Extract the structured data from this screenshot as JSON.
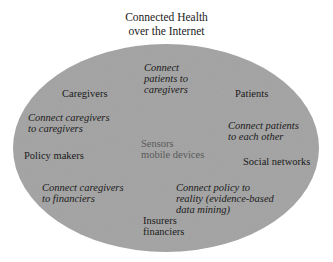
{
  "title": {
    "line1": "Connected Health",
    "line2": "over the Internet"
  },
  "ellipse": {
    "fill": "#a3a3a3",
    "cx": 166,
    "cy": 148,
    "rx": 153,
    "ry": 104
  },
  "center": {
    "line1": "Sensors",
    "line2": "mobile devices"
  },
  "stakeholders": {
    "caregivers": "Caregivers",
    "patients": "Patients",
    "policy_makers": "Policy makers",
    "social_networks": "Social networks",
    "insurers_line1": "Insurers",
    "insurers_line2": "financiers"
  },
  "connections": {
    "patients_caregivers": [
      "Connect",
      "patients to",
      "caregivers"
    ],
    "caregivers_caregivers": [
      "Connect caregivers",
      "to caregivers"
    ],
    "patients_each_other": [
      "Connect patients",
      "to each other"
    ],
    "caregivers_financiers": [
      "Connect caregivers",
      "to financiers"
    ],
    "policy_reality": [
      "Connect policy to",
      "reality (evidence-based",
      "data mining)"
    ]
  }
}
